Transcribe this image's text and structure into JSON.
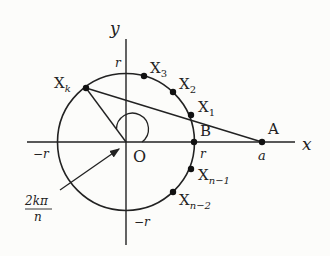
{
  "diagram": {
    "axes": {
      "x_label": "x",
      "y_label": "y",
      "origin_label": "O"
    },
    "axis_ticks": {
      "r_top": "r",
      "r_right": "r",
      "neg_r_left": "−r",
      "neg_r_bottom": "−r",
      "a": "a"
    },
    "points": {
      "A": {
        "label": "A",
        "x": 262,
        "y": 142
      },
      "B": {
        "label": "B",
        "x": 194,
        "y": 142
      },
      "X1": {
        "label": "X",
        "sub": "1",
        "x": 191,
        "y": 115
      },
      "X2": {
        "label": "X",
        "sub": "2",
        "x": 173,
        "y": 92
      },
      "X3": {
        "label": "X",
        "sub": "3",
        "x": 144,
        "y": 76
      },
      "Xk": {
        "label": "X",
        "sub": "k",
        "x": 86,
        "y": 88
      },
      "Xn1": {
        "label": "X",
        "sub": "n−1",
        "x": 191,
        "y": 169
      },
      "Xn2": {
        "label": "X",
        "sub": "n−2",
        "x": 173,
        "y": 192
      }
    },
    "angle_label": {
      "numerator": "2kπ",
      "denominator": "n"
    },
    "colors": {
      "stroke": "#222222",
      "background": "#fcfcfa"
    }
  }
}
